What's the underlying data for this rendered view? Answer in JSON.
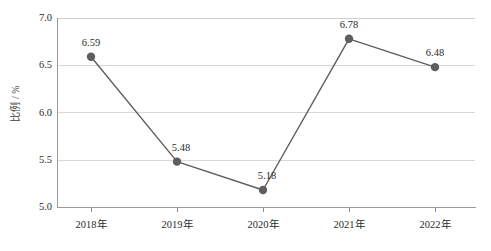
{
  "chart_data": {
    "type": "line",
    "title": "",
    "subtitle": "",
    "xlabel": "",
    "ylabel": "比例 / %",
    "categories": [
      "2018年",
      "2019年",
      "2020年",
      "2021年",
      "2022年"
    ],
    "values": [
      6.59,
      5.48,
      5.18,
      6.78,
      6.48
    ],
    "point_labels": [
      "6.59",
      "5.48",
      "5.18",
      "6.78",
      "6.48"
    ],
    "ylim": [
      5.0,
      7.0
    ],
    "ytick_labels": [
      "5.0",
      "5.5",
      "6.0",
      "6.5",
      "7.0"
    ],
    "ytick_values": [
      5.0,
      5.5,
      6.0,
      6.5,
      7.0
    ],
    "grid": true,
    "grid_axis": "y",
    "legend": false,
    "legend_position": "none",
    "series": [
      {
        "name": "比例",
        "values": [
          6.59,
          5.48,
          5.18,
          6.78,
          6.48
        ]
      }
    ],
    "colors": {
      "line": "#5e5e5e",
      "marker": "#5e5e5e",
      "grid": "#d8d8d8",
      "axis": "#9a9a9a",
      "text": "#2b2b2b",
      "background": "#ffffff"
    }
  }
}
